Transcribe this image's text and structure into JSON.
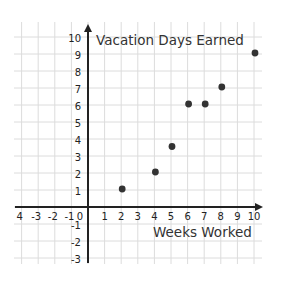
{
  "chart_data": {
    "type": "scatter",
    "title": "",
    "xlabel": "Weeks Worked",
    "ylabel": "Vacation Days Earned",
    "x_ticks": [
      "4",
      "-3",
      "-2",
      "-1",
      "0",
      "1",
      "2",
      "3",
      "4",
      "5",
      "6",
      "7",
      "8",
      "9",
      "10"
    ],
    "x_tick_values": [
      -4,
      -3,
      -2,
      -1,
      0,
      1,
      2,
      3,
      4,
      5,
      6,
      7,
      8,
      9,
      10
    ],
    "y_ticks": [
      "10",
      "9",
      "8",
      "7",
      "6",
      "5",
      "4",
      "3",
      "2",
      "1",
      "-1",
      "-2",
      "-3"
    ],
    "y_tick_values": [
      10,
      9,
      8,
      7,
      6,
      5,
      4,
      3,
      2,
      1,
      -1,
      -2,
      -3
    ],
    "origin_label": "0",
    "xlim": [
      -4,
      10.5
    ],
    "ylim": [
      -3,
      10.5
    ],
    "grid": true,
    "series": [
      {
        "name": "Vacation Days Earned",
        "x": [
          2,
          4,
          5,
          6,
          7,
          8,
          10
        ],
        "y": [
          1,
          2,
          3.5,
          6,
          6,
          7,
          9
        ]
      }
    ],
    "colors": {
      "point": "#333333",
      "axis": "#222222",
      "grid": "#dcdcdc"
    }
  }
}
